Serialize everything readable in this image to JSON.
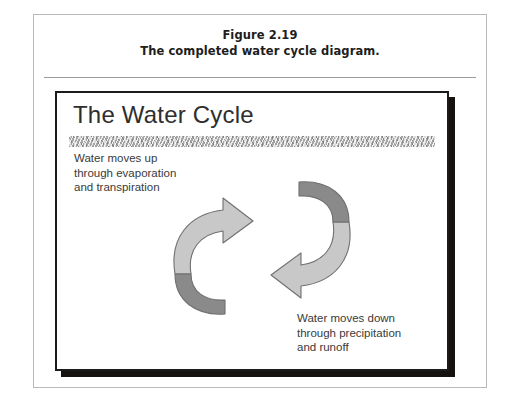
{
  "figure": {
    "caption_title": "Figure 2.19",
    "caption_subtitle": "The completed water cycle diagram."
  },
  "slide": {
    "title": "The Water Cycle",
    "text_up": "Water moves up\nthrough evaporation\nand transpiration",
    "text_down": "Water moves down\nthrough precipitation\nand runoff"
  },
  "colors": {
    "arrow_light": "#c8c8c8",
    "arrow_dark": "#8a8a8a",
    "arrow_stroke": "#6f6f6f",
    "slide_border": "#1b1b1b",
    "slide_shadow": "#15120f",
    "title_band": "#b4b4b4",
    "frame_border": "#b9b9b9",
    "rule": "#9a9a9a"
  }
}
